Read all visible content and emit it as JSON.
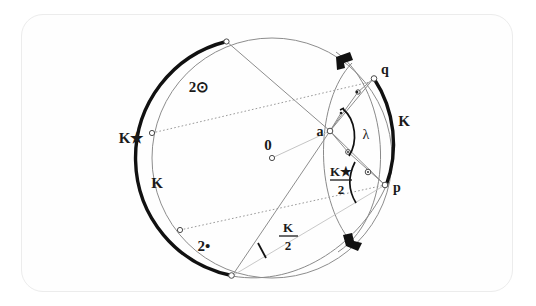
{
  "figure": {
    "type": "geometric-diagram",
    "background_color": "#ffffff",
    "frame_color": "#ececec",
    "thick_arc_color": "#111111",
    "thin_line_color": "#8a8a8a",
    "dotted_line_color": "#9a9a9a",
    "label_color": "#1a1a1a"
  },
  "labels": {
    "center": "0",
    "point_a": "a",
    "point_p": "p",
    "point_q": "q",
    "arc_k_star": "K★",
    "arc_k_left": "K",
    "arc_k_right": "K",
    "two_sun": "2⊙",
    "two_dot": "2•",
    "lambda": "λ",
    "frac_k_star_num": "K★",
    "frac_k_star_den": "2",
    "frac_k_num": "K",
    "frac_k_den": "2"
  },
  "geometry": {
    "circle": {
      "cx": 272,
      "cy": 158,
      "r": 120
    },
    "points": {
      "center": {
        "x": 272,
        "y": 158,
        "label": "0"
      },
      "a": {
        "x": 330,
        "y": 131,
        "label": "a"
      },
      "p": {
        "x": 385,
        "y": 185,
        "label": "p"
      },
      "q": {
        "x": 374,
        "y": 78,
        "label": "q"
      },
      "k_star_end": {
        "x": 152,
        "y": 133,
        "label": "K★ endpoint"
      },
      "top_node": {
        "x": 226,
        "y": 41,
        "label": "upper chord node"
      },
      "lower_left_node": {
        "x": 180,
        "y": 230,
        "label": "lower-left node"
      },
      "bottom_node": {
        "x": 232,
        "y": 276,
        "label": "bottom node"
      }
    },
    "thick_arcs": [
      {
        "name": "left-arc",
        "start_deg": 138,
        "end_deg": 243,
        "note": "spans K★ and K region on left"
      },
      {
        "name": "right-arc",
        "start_deg": -38,
        "end_deg": 13,
        "note": "spans K region near q and p"
      }
    ],
    "right_angle_markers": [
      {
        "x": 344,
        "y": 60,
        "rotation": -35
      },
      {
        "x": 350,
        "y": 242,
        "rotation": 30
      }
    ],
    "angle_arcs": [
      {
        "name": "lambda-angle",
        "vertex": "a",
        "label": "λ"
      },
      {
        "name": "k-star-over-2-angle",
        "vertex": "p",
        "label": "K★/2"
      },
      {
        "name": "k-over-2-angle",
        "vertex": "bottom_node",
        "label": "K/2"
      }
    ]
  },
  "annotations": {
    "tick_marks": 3,
    "small_circle_markers": 9
  }
}
